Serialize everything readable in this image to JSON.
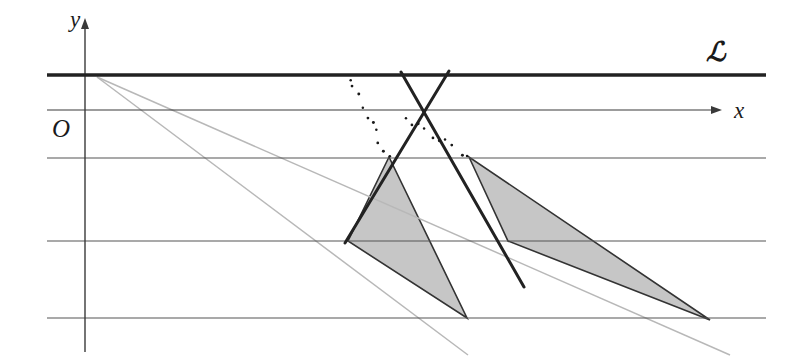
{
  "figure": {
    "kind": "geometry-diagram",
    "width": 812,
    "height": 358,
    "background": "#ffffff"
  },
  "labels": {
    "y_axis": "y",
    "x_axis": "x",
    "origin": "O",
    "line_script": "ℒ"
  },
  "colors": {
    "ink": "#1a1a1a",
    "thick_stroke": "#222222",
    "grid_stroke": "#555555",
    "ray_stroke": "#b8b8b8",
    "shade_fill": "#bcbcbc",
    "shade_stroke": "#333333",
    "dot_color": "#1a1a1a",
    "background": "#ffffff"
  },
  "geometry": {
    "axes": {
      "y_axis": {
        "x": 85,
        "y_top": 18,
        "y_bottom": 352,
        "arrow": "up"
      },
      "x_axis": {
        "y": 110,
        "x_left": 47,
        "x_right": 722,
        "arrow": "right"
      }
    },
    "line_L": {
      "y": 75,
      "x_start": 47,
      "x_end": 766,
      "width": 3.2
    },
    "grid_lines": [
      {
        "y": 158,
        "x_start": 47,
        "x_end": 766
      },
      {
        "y": 241,
        "x_start": 47,
        "x_end": 766
      },
      {
        "y": 318,
        "x_start": 47,
        "x_end": 766
      }
    ],
    "gray_rays": [
      {
        "x1": 97,
        "y1": 77,
        "x2": 468,
        "y2": 355
      },
      {
        "x1": 97,
        "y1": 77,
        "x2": 730,
        "y2": 355
      }
    ],
    "thick_lines": [
      {
        "x1": 401,
        "y1": 72,
        "x2": 524,
        "y2": 287,
        "name": "left-apex-down-right"
      },
      {
        "x1": 449,
        "y1": 71,
        "x2": 345,
        "y2": 243,
        "name": "right-apex-down-left"
      }
    ],
    "crossing_point": {
      "x": 432,
      "y": 73
    },
    "shaded_regions": [
      {
        "name": "left-shaded-triangle",
        "points": "389,157 348,241 467,318"
      },
      {
        "name": "right-shaded-triangle",
        "points": "469,157 508,241 710,320"
      }
    ],
    "dotted_lines": [
      {
        "x1": 347,
        "y1": 80,
        "x2": 390,
        "y2": 157,
        "dots": 9
      },
      {
        "x1": 407,
        "y1": 118,
        "x2": 467,
        "y2": 156,
        "dots": 9
      }
    ]
  }
}
